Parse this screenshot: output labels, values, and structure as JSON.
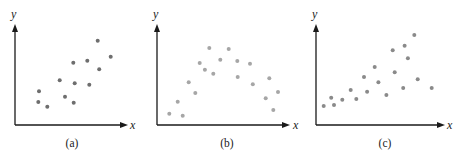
{
  "figure": {
    "panels": [
      {
        "id": "a",
        "caption": "(a)",
        "xlabel": "x",
        "ylabel": "y",
        "dot_color": "#6e6e6e"
      },
      {
        "id": "b",
        "caption": "(b)",
        "xlabel": "x",
        "ylabel": "y",
        "dot_color": "#a6a6a6"
      },
      {
        "id": "c",
        "caption": "(c)",
        "xlabel": "x",
        "ylabel": "y",
        "dot_color": "#8a8a8a"
      }
    ]
  },
  "chart_data": [
    {
      "type": "scatter",
      "title": "(a)",
      "xlabel": "x",
      "ylabel": "y",
      "xlim": [
        0,
        10
      ],
      "ylim": [
        0,
        10
      ],
      "grid": false,
      "ticks": false,
      "description": "positive linear association",
      "x": [
        7.45,
        8.62,
        6.51,
        5.25,
        7.59,
        4.03,
        5.38,
        6.69,
        2.16,
        4.5,
        2.1,
        5.29,
        2.91
      ],
      "y": [
        8.52,
        6.9,
        6.49,
        6.29,
        5.63,
        4.52,
        4.21,
        4.07,
        3.4,
        2.86,
        2.32,
        2.25,
        1.85
      ]
    },
    {
      "type": "scatter",
      "title": "(b)",
      "xlabel": "x",
      "ylabel": "y",
      "xlim": [
        0,
        10
      ],
      "ylim": [
        0,
        10
      ],
      "grid": false,
      "ticks": false,
      "description": "curvilinear (inverted U) association",
      "x": [
        3.99,
        5.47,
        4.83,
        3.26,
        6.13,
        7.1,
        3.66,
        4.3,
        6.16,
        8.57,
        2.42,
        7.31,
        2.92,
        9.24,
        8.3,
        1.58,
        8.88,
        0.94,
        1.96
      ],
      "y": [
        7.78,
        7.68,
        6.6,
        6.26,
        6.46,
        6.19,
        5.59,
        5.18,
        4.85,
        4.72,
        4.31,
        4.11,
        3.23,
        3.33,
        2.7,
        2.35,
        1.52,
        1.14,
        0.94
      ]
    },
    {
      "type": "scatter",
      "title": "(c)",
      "xlabel": "x",
      "ylabel": "y",
      "xlim": [
        0,
        10
      ],
      "ylim": [
        0,
        10
      ],
      "grid": false,
      "ticks": false,
      "description": "positive association with increasing spread (heteroscedastic)",
      "x": [
        7.74,
        6.98,
        6.04,
        7.24,
        4.62,
        6.2,
        3.78,
        8.01,
        4.91,
        2.73,
        6.87,
        9.11,
        4.02,
        5.54,
        1.2,
        3.17,
        2.07,
        1.42,
        0.61
      ],
      "y": [
        9.09,
        8.01,
        7.55,
        6.74,
        5.86,
        5.32,
        4.85,
        4.62,
        4.31,
        3.54,
        3.74,
        3.74,
        3.36,
        3.03,
        2.76,
        2.63,
        2.56,
        2.02,
        1.92
      ]
    }
  ]
}
